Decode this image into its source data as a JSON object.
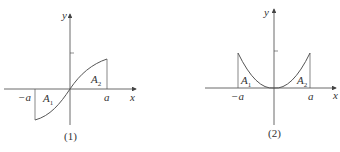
{
  "figures": [
    {
      "caption": "(1)",
      "x_label": "x",
      "y_label": "y",
      "neg_a": "−a",
      "pos_a": "a",
      "area1": "A",
      "area1_sub": "1",
      "area2": "A",
      "area2_sub": "2",
      "curve": "odd function through origin, from (−a, negative) to (a, positive)"
    },
    {
      "caption": "(2)",
      "x_label": "x",
      "y_label": "y",
      "neg_a": "−a",
      "pos_a": "a",
      "area1": "A",
      "area1_sub": "1",
      "area2": "A",
      "area2_sub": "2",
      "curve": "even function (parabola-like) with minimum at origin"
    }
  ],
  "colors": {
    "curve": "#555555",
    "axis": "#444444",
    "text": "#333333"
  }
}
